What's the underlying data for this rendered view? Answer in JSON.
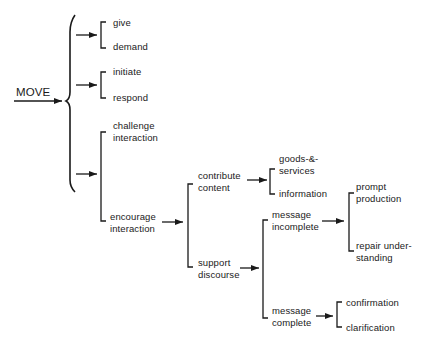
{
  "diagram": {
    "type": "system-network",
    "root": "MOVE",
    "nodes": {
      "move": "MOVE",
      "give": "give",
      "demand": "demand",
      "initiate": "initiate",
      "respond": "respond",
      "challenge": [
        "challenge",
        "interaction"
      ],
      "encourage": [
        "encourage",
        "interaction"
      ],
      "contribute": [
        "contribute",
        "content"
      ],
      "support": [
        "support",
        "discourse"
      ],
      "goods": [
        "goods-&-",
        "services"
      ],
      "information": "information",
      "msg_incomplete": [
        "message",
        "incomplete"
      ],
      "msg_complete": [
        "message",
        "complete"
      ],
      "prompt": [
        "prompt",
        "production"
      ],
      "repair": [
        "repair under-",
        "standing"
      ],
      "confirmation": "confirmation",
      "clarification": "clarification"
    },
    "edges": [
      {
        "from": "MOVE",
        "to": [
          "give|demand",
          "initiate|respond",
          "challenge interaction|encourage interaction"
        ],
        "kind": "and-brace"
      },
      {
        "from": "encourage interaction",
        "to": [
          "contribute content",
          "support discourse"
        ],
        "kind": "or-bracket"
      },
      {
        "from": "contribute content",
        "to": [
          "goods-&-services",
          "information"
        ],
        "kind": "or-bracket"
      },
      {
        "from": "support discourse",
        "to": [
          "message incomplete",
          "message complete"
        ],
        "kind": "or-bracket"
      },
      {
        "from": "message incomplete",
        "to": [
          "prompt production",
          "repair understanding"
        ],
        "kind": "or-bracket"
      },
      {
        "from": "message complete",
        "to": [
          "confirmation",
          "clarification"
        ],
        "kind": "or-bracket"
      }
    ],
    "colors": {
      "ink": "#1a1a1a",
      "background": "#ffffff"
    }
  }
}
